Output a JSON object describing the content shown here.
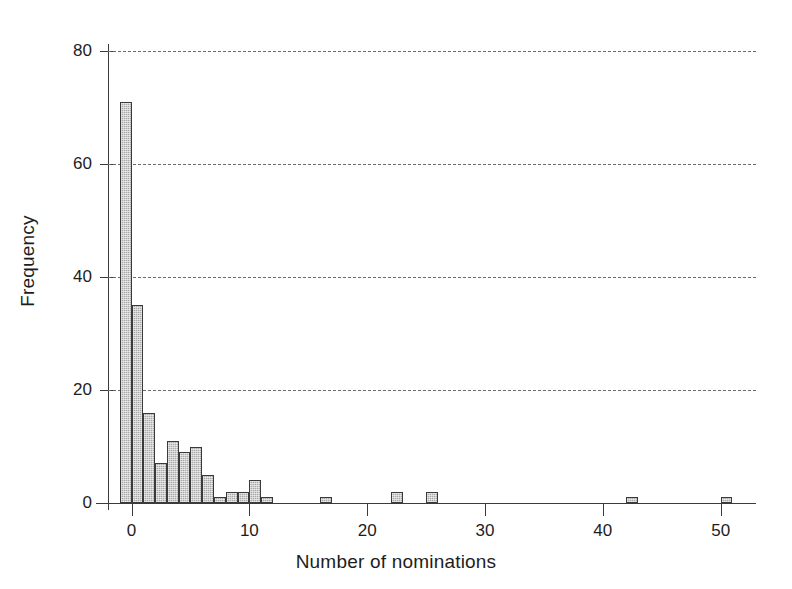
{
  "chart_data": {
    "type": "bar",
    "title": "",
    "subtitle": "",
    "xlabel": "Number of nominations",
    "ylabel": "Frequency",
    "xlim": [
      -2,
      53
    ],
    "ylim": [
      0,
      80
    ],
    "xticks": [
      0,
      10,
      20,
      30,
      40,
      50
    ],
    "yticks": [
      0,
      20,
      40,
      60,
      80
    ],
    "xticklabels": [
      "0",
      "10",
      "20",
      "30",
      "40",
      "50"
    ],
    "yticklabels": [
      "0",
      "20",
      "40",
      "60",
      "80"
    ],
    "grid": "horizontal-dashed",
    "legend": "none",
    "bin_width": 1,
    "bar_color": "#a8a8a8",
    "bar_edge_color": "#3a3a3a",
    "axis_color": "#3b3b3b",
    "gridline_color": "#6b6b6b",
    "categories": [
      -1,
      0,
      1,
      2,
      3,
      4,
      5,
      6,
      7,
      8,
      9,
      10,
      11,
      12,
      17,
      23,
      26,
      43,
      51
    ],
    "values": [
      71,
      35,
      16,
      7,
      11,
      9,
      10,
      5,
      1,
      2,
      2,
      4,
      1,
      0,
      1,
      2,
      2,
      1,
      1
    ],
    "bars": [
      {
        "x": -1,
        "height": 71
      },
      {
        "x": 0,
        "height": 35
      },
      {
        "x": 1,
        "height": 16
      },
      {
        "x": 2,
        "height": 7
      },
      {
        "x": 3,
        "height": 11
      },
      {
        "x": 4,
        "height": 9
      },
      {
        "x": 5,
        "height": 10
      },
      {
        "x": 6,
        "height": 5
      },
      {
        "x": 7,
        "height": 1
      },
      {
        "x": 8,
        "height": 2
      },
      {
        "x": 9,
        "height": 2
      },
      {
        "x": 10,
        "height": 4
      },
      {
        "x": 11,
        "height": 1
      },
      {
        "x": 16,
        "height": 1
      },
      {
        "x": 22,
        "height": 2
      },
      {
        "x": 25,
        "height": 2
      },
      {
        "x": 42,
        "height": 1
      },
      {
        "x": 50,
        "height": 1
      }
    ]
  }
}
